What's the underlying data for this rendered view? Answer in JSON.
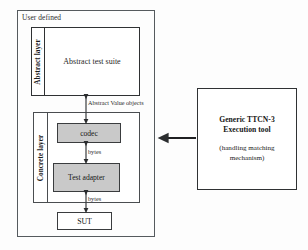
{
  "diagram": {
    "title_region": "TTCN-3 test system architecture",
    "outer": {
      "label": "User defined"
    },
    "abstract_layer": {
      "side_label": "Abstract layer",
      "content": "Abstract test suite"
    },
    "concrete_layer": {
      "side_label": "Concrete layer",
      "blocks": [
        {
          "name": "codec-block",
          "label": "codec"
        },
        {
          "name": "test-adapter-block",
          "label": "Test adapter"
        }
      ]
    },
    "sut": {
      "label": "SUT"
    },
    "tool": {
      "title_line1": "Generic TTCN-3",
      "title_line2": "Execution tool",
      "subtitle_line1": "(handling matching",
      "subtitle_line2": "mechanism)"
    },
    "connectors": [
      {
        "name": "abstract-value-objects-label",
        "label": "Abstract Value  objects"
      },
      {
        "name": "bytes-label-codec-adapter",
        "label": "bytes"
      },
      {
        "name": "bytes-label-adapter-sut",
        "label": "bytes"
      }
    ],
    "colors": {
      "block_fill": "#c9c9c9",
      "stroke": "#2f3133",
      "frame_stroke": "#555a5e",
      "background": "#fdfdfd",
      "text": "#1f1f1f"
    }
  }
}
